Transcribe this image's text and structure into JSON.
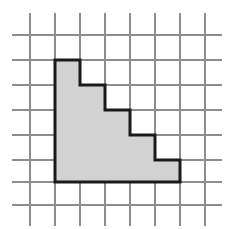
{
  "figure": {
    "canvas": {
      "width": 235,
      "height": 229,
      "background": "#ffffff"
    },
    "grid": {
      "cell_size": 25,
      "line_color": "#8d8d8d",
      "line_width": 1.4,
      "vertical_x": [
        30,
        55,
        80,
        105,
        130,
        155,
        180,
        205
      ],
      "vertical_y_start": 13,
      "vertical_y_end": 226,
      "horizontal_y": [
        35,
        60,
        85,
        110,
        135,
        160,
        182,
        205
      ],
      "horizontal_x_start": 12,
      "horizontal_x_end": 222,
      "columns": 8,
      "rows": 8
    },
    "shape": {
      "name": "staircase",
      "fill_color": "#d2d2d2",
      "stroke_color": "#1a1a1a",
      "stroke_width": 3,
      "steps": 5,
      "points": "55,60 80,60 80,85 105,85 105,110 130,110 130,135 155,135 155,160 180,160 180,182 55,182",
      "vertices": [
        [
          55,
          60
        ],
        [
          80,
          60
        ],
        [
          80,
          85
        ],
        [
          105,
          85
        ],
        [
          105,
          110
        ],
        [
          130,
          110
        ],
        [
          130,
          135
        ],
        [
          155,
          135
        ],
        [
          155,
          160
        ],
        [
          180,
          160
        ],
        [
          180,
          182
        ],
        [
          55,
          182
        ]
      ],
      "column_heights_cells": [
        5,
        4,
        3,
        2,
        1
      ],
      "area_cells": 15
    }
  },
  "chart_data": {
    "type": "bar",
    "xlabel": "",
    "ylabel": "",
    "categories": [
      "1",
      "2",
      "3",
      "4",
      "5"
    ],
    "values": [
      5,
      4,
      3,
      2,
      1
    ],
    "ylim": [
      0,
      5
    ],
    "grid": true,
    "legend": "none"
  }
}
